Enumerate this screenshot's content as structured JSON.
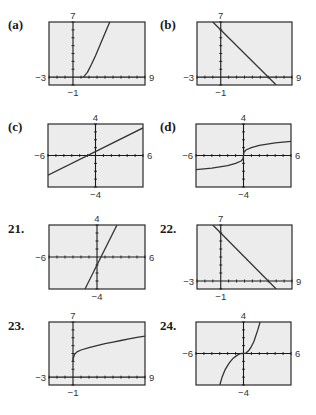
{
  "chart_data": [
    {
      "id": "a",
      "label": "(a)",
      "type": "line",
      "xlim": [
        -3,
        9
      ],
      "ylim": [
        -1,
        7
      ],
      "tick_labels": {
        "xmin": "−3",
        "xmax": "9",
        "ymin": "−1",
        "ymax": "7"
      },
      "series": [
        {
          "name": "graph a",
          "x": [
            1.3,
            1.8,
            2.3,
            2.8,
            3.3,
            3.8,
            4.3,
            4.6
          ],
          "y": [
            0.0,
            0.6,
            1.6,
            2.7,
            3.9,
            5.1,
            6.3,
            7.0
          ]
        }
      ]
    },
    {
      "id": "b",
      "label": "(b)",
      "type": "line",
      "xlim": [
        -3,
        9
      ],
      "ylim": [
        -1,
        7
      ],
      "tick_labels": {
        "xmin": "−3",
        "xmax": "9",
        "ymin": "−1",
        "ymax": "7"
      },
      "series": [
        {
          "name": "graph b",
          "x": [
            -1.0,
            7.0
          ],
          "y": [
            7.0,
            -1.0
          ]
        }
      ]
    },
    {
      "id": "c",
      "label": "(c)",
      "type": "line",
      "xlim": [
        -6,
        6
      ],
      "ylim": [
        -4,
        4
      ],
      "tick_labels": {
        "xmin": "−6",
        "xmax": "6",
        "ymin": "−4",
        "ymax": "4"
      },
      "series": [
        {
          "name": "graph c",
          "x": [
            -6.0,
            6.0
          ],
          "y": [
            -2.5,
            3.5
          ]
        }
      ]
    },
    {
      "id": "d",
      "label": "(d)",
      "type": "line",
      "xlim": [
        -6,
        6
      ],
      "ylim": [
        -4,
        4
      ],
      "tick_labels": {
        "xmin": "−6",
        "xmax": "6",
        "ymin": "−4",
        "ymax": "4"
      },
      "series": [
        {
          "name": "graph d",
          "x": [
            -6.0,
            -4.0,
            -2.0,
            -1.0,
            -0.3,
            -0.05,
            0.0,
            0.05,
            0.3,
            1.0,
            2.0,
            4.0,
            6.0
          ],
          "y": [
            -1.8,
            -1.6,
            -1.3,
            -1.0,
            -0.7,
            -0.4,
            0.0,
            0.4,
            0.7,
            1.0,
            1.3,
            1.6,
            1.8
          ]
        }
      ]
    },
    {
      "id": "21",
      "label": "21.",
      "type": "line",
      "xlim": [
        -6,
        6
      ],
      "ylim": [
        -4,
        4
      ],
      "tick_labels": {
        "xmin": "−6",
        "xmax": "6",
        "ymin": "−4",
        "ymax": "4"
      },
      "series": [
        {
          "name": "graph 21",
          "x": [
            -1.5,
            2.5
          ],
          "y": [
            -4.0,
            4.0
          ]
        }
      ]
    },
    {
      "id": "22",
      "label": "22.",
      "type": "line",
      "xlim": [
        -3,
        9
      ],
      "ylim": [
        -1,
        7
      ],
      "tick_labels": {
        "xmin": "−3",
        "xmax": "9",
        "ymin": "−1",
        "ymax": "7"
      },
      "series": [
        {
          "name": "graph 22",
          "x": [
            -1.0,
            7.0
          ],
          "y": [
            7.0,
            -1.0
          ]
        }
      ]
    },
    {
      "id": "23",
      "label": "23.",
      "type": "line",
      "xlim": [
        -3,
        9
      ],
      "ylim": [
        -1,
        7
      ],
      "tick_labels": {
        "xmin": "−3",
        "xmax": "9",
        "ymin": "−1",
        "ymax": "7"
      },
      "series": [
        {
          "name": "graph 23",
          "x": [
            0.0,
            0.05,
            0.2,
            0.5,
            1.0,
            2.0,
            3.0,
            4.0,
            5.0,
            6.0,
            7.0,
            8.0,
            9.0
          ],
          "y": [
            2.0,
            2.45,
            2.9,
            3.2,
            3.45,
            3.75,
            4.0,
            4.25,
            4.45,
            4.65,
            4.85,
            5.05,
            5.2
          ]
        }
      ]
    },
    {
      "id": "24",
      "label": "24.",
      "type": "line",
      "xlim": [
        -6,
        6
      ],
      "ylim": [
        -4,
        4
      ],
      "tick_labels": {
        "xmin": "−6",
        "xmax": "6",
        "ymin": "−4",
        "ymax": "4"
      },
      "series": [
        {
          "name": "graph 24",
          "x": [
            -3.0,
            -2.7,
            -2.3,
            -1.8,
            -1.3,
            -0.9,
            -0.6,
            -0.3,
            0.0,
            0.3,
            0.6,
            0.9,
            1.3,
            1.8,
            2.1
          ],
          "y": [
            -4.0,
            -3.0,
            -2.0,
            -1.2,
            -0.6,
            -0.3,
            -0.1,
            0.0,
            0.0,
            0.05,
            0.3,
            0.7,
            1.5,
            3.0,
            4.0
          ]
        }
      ]
    }
  ],
  "colors": {
    "frame_fill": "#ececec",
    "frame_border": "#2a2a2a",
    "axis": "#1a1a1a",
    "curve": "#333333"
  }
}
